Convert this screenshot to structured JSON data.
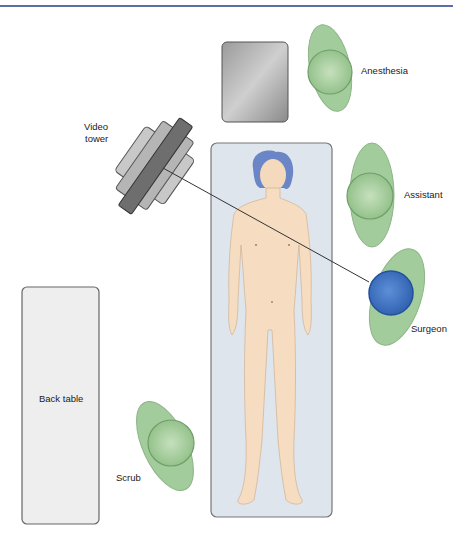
{
  "figure": {
    "type": "operating-room-layout",
    "labels": {
      "anesthesia": "Anesthesia",
      "video_tower_line1": "Video",
      "video_tower_line2": "tower",
      "assistant": "Assistant",
      "surgeon": "Surgeon",
      "back_table": "Back table",
      "scrub": "Scrub"
    },
    "colors": {
      "header_rule": "#5a6fa8",
      "staff_body": "#8fc08a",
      "staff_head": "#a9cf9f",
      "surgeon_head": "#3f72c4",
      "patient_skin": "#f6dcc0",
      "patient_hair": "#6a86c6",
      "table": "#dde3ea",
      "back_table": "#eeeeee",
      "equipment": "#8a8a8a"
    }
  }
}
